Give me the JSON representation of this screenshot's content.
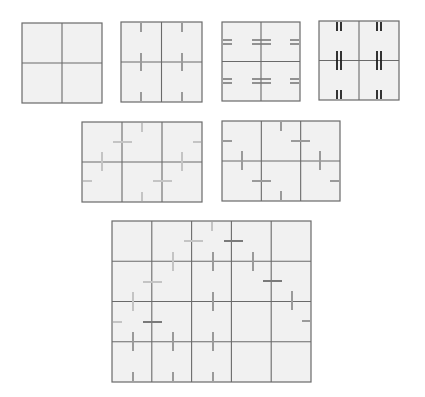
{
  "colors": {
    "background": "#ffffff",
    "panel_fill": "#f1f1f1",
    "grid": "#6a6a6a",
    "mark_light": "#c4c4c4",
    "mark_mid": "#9a9a9a",
    "mark_dark": "#7a7a7a",
    "mark_black": "#1e1e1e"
  },
  "panels": [
    {
      "id": "panel-2x2-empty",
      "x": 22,
      "y": 23,
      "w": 80,
      "h": 80,
      "cols": 2,
      "rows": 2,
      "marks": []
    },
    {
      "id": "panel-2x2-vertical-ticks",
      "x": 121,
      "y": 22,
      "w": 81,
      "h": 80,
      "cols": 2,
      "rows": 2,
      "marks": [
        {
          "x1": 141,
          "y1": 23,
          "x2": 141,
          "y2": 32,
          "color": "mark_mid",
          "w": 2
        },
        {
          "x1": 182,
          "y1": 23,
          "x2": 182,
          "y2": 32,
          "color": "mark_mid",
          "w": 2
        },
        {
          "x1": 141,
          "y1": 53,
          "x2": 141,
          "y2": 71,
          "color": "mark_mid",
          "w": 2
        },
        {
          "x1": 182,
          "y1": 53,
          "x2": 182,
          "y2": 71,
          "color": "mark_mid",
          "w": 2
        },
        {
          "x1": 141,
          "y1": 92,
          "x2": 141,
          "y2": 101,
          "color": "mark_mid",
          "w": 2
        },
        {
          "x1": 182,
          "y1": 92,
          "x2": 182,
          "y2": 101,
          "color": "mark_mid",
          "w": 2
        }
      ]
    },
    {
      "id": "panel-2x2-double-horizontal",
      "x": 222,
      "y": 22,
      "w": 78,
      "h": 79,
      "cols": 2,
      "rows": 2,
      "marks": [
        {
          "x1": 223,
          "y1": 40,
          "x2": 232,
          "y2": 40,
          "color": "mark_dark",
          "w": 1.6
        },
        {
          "x1": 223,
          "y1": 44,
          "x2": 232,
          "y2": 44,
          "color": "mark_dark",
          "w": 1.6
        },
        {
          "x1": 252,
          "y1": 40,
          "x2": 271,
          "y2": 40,
          "color": "mark_dark",
          "w": 1.6
        },
        {
          "x1": 252,
          "y1": 44,
          "x2": 271,
          "y2": 44,
          "color": "mark_dark",
          "w": 1.6
        },
        {
          "x1": 290,
          "y1": 40,
          "x2": 299,
          "y2": 40,
          "color": "mark_dark",
          "w": 1.6
        },
        {
          "x1": 290,
          "y1": 44,
          "x2": 299,
          "y2": 44,
          "color": "mark_dark",
          "w": 1.6
        },
        {
          "x1": 223,
          "y1": 79,
          "x2": 232,
          "y2": 79,
          "color": "mark_dark",
          "w": 1.6
        },
        {
          "x1": 223,
          "y1": 83,
          "x2": 232,
          "y2": 83,
          "color": "mark_dark",
          "w": 1.6
        },
        {
          "x1": 252,
          "y1": 79,
          "x2": 271,
          "y2": 79,
          "color": "mark_dark",
          "w": 1.6
        },
        {
          "x1": 252,
          "y1": 83,
          "x2": 271,
          "y2": 83,
          "color": "mark_dark",
          "w": 1.6
        },
        {
          "x1": 290,
          "y1": 79,
          "x2": 299,
          "y2": 79,
          "color": "mark_dark",
          "w": 1.6
        },
        {
          "x1": 290,
          "y1": 83,
          "x2": 299,
          "y2": 83,
          "color": "mark_dark",
          "w": 1.6
        }
      ]
    },
    {
      "id": "panel-2x2-double-vertical",
      "x": 319,
      "y": 21,
      "w": 80,
      "h": 79,
      "cols": 2,
      "rows": 2,
      "marks": [
        {
          "x1": 337,
          "y1": 22,
          "x2": 337,
          "y2": 31,
          "color": "mark_black",
          "w": 1.8
        },
        {
          "x1": 341,
          "y1": 22,
          "x2": 341,
          "y2": 31,
          "color": "mark_black",
          "w": 1.8
        },
        {
          "x1": 377,
          "y1": 22,
          "x2": 377,
          "y2": 31,
          "color": "mark_black",
          "w": 1.8
        },
        {
          "x1": 381,
          "y1": 22,
          "x2": 381,
          "y2": 31,
          "color": "mark_black",
          "w": 1.8
        },
        {
          "x1": 337,
          "y1": 51,
          "x2": 337,
          "y2": 70,
          "color": "mark_black",
          "w": 1.8
        },
        {
          "x1": 341,
          "y1": 51,
          "x2": 341,
          "y2": 70,
          "color": "mark_black",
          "w": 1.8
        },
        {
          "x1": 377,
          "y1": 51,
          "x2": 377,
          "y2": 70,
          "color": "mark_black",
          "w": 1.8
        },
        {
          "x1": 381,
          "y1": 51,
          "x2": 381,
          "y2": 70,
          "color": "mark_black",
          "w": 1.8
        },
        {
          "x1": 337,
          "y1": 90,
          "x2": 337,
          "y2": 99,
          "color": "mark_black",
          "w": 1.8
        },
        {
          "x1": 341,
          "y1": 90,
          "x2": 341,
          "y2": 99,
          "color": "mark_black",
          "w": 1.8
        },
        {
          "x1": 377,
          "y1": 90,
          "x2": 377,
          "y2": 99,
          "color": "mark_black",
          "w": 1.8
        },
        {
          "x1": 381,
          "y1": 90,
          "x2": 381,
          "y2": 99,
          "color": "mark_black",
          "w": 1.8
        }
      ]
    },
    {
      "id": "panel-3x2-light-marks",
      "x": 82,
      "y": 122,
      "w": 120,
      "h": 80,
      "cols": 3,
      "rows": 2,
      "marks": [
        {
          "x1": 142,
          "y1": 123,
          "x2": 142,
          "y2": 132,
          "color": "mark_light",
          "w": 2
        },
        {
          "x1": 113,
          "y1": 142,
          "x2": 132,
          "y2": 142,
          "color": "mark_light",
          "w": 2
        },
        {
          "x1": 193,
          "y1": 142,
          "x2": 201,
          "y2": 142,
          "color": "mark_light",
          "w": 2
        },
        {
          "x1": 102,
          "y1": 152,
          "x2": 102,
          "y2": 171,
          "color": "mark_light",
          "w": 2
        },
        {
          "x1": 182,
          "y1": 152,
          "x2": 182,
          "y2": 171,
          "color": "mark_light",
          "w": 2
        },
        {
          "x1": 83,
          "y1": 181,
          "x2": 92,
          "y2": 181,
          "color": "mark_light",
          "w": 2
        },
        {
          "x1": 153,
          "y1": 181,
          "x2": 172,
          "y2": 181,
          "color": "mark_light",
          "w": 2
        },
        {
          "x1": 142,
          "y1": 192,
          "x2": 142,
          "y2": 201,
          "color": "mark_light",
          "w": 2
        }
      ]
    },
    {
      "id": "panel-3x2-mid-marks",
      "x": 222,
      "y": 121,
      "w": 118,
      "h": 80,
      "cols": 3,
      "rows": 2,
      "marks": [
        {
          "x1": 281,
          "y1": 122,
          "x2": 281,
          "y2": 131,
          "color": "mark_mid",
          "w": 2
        },
        {
          "x1": 223,
          "y1": 141,
          "x2": 232,
          "y2": 141,
          "color": "mark_mid",
          "w": 2
        },
        {
          "x1": 291,
          "y1": 141,
          "x2": 310,
          "y2": 141,
          "color": "mark_mid",
          "w": 2
        },
        {
          "x1": 242,
          "y1": 151,
          "x2": 242,
          "y2": 170,
          "color": "mark_mid",
          "w": 2
        },
        {
          "x1": 320,
          "y1": 151,
          "x2": 320,
          "y2": 170,
          "color": "mark_mid",
          "w": 2
        },
        {
          "x1": 252,
          "y1": 181,
          "x2": 271,
          "y2": 181,
          "color": "mark_mid",
          "w": 2
        },
        {
          "x1": 330,
          "y1": 181,
          "x2": 339,
          "y2": 181,
          "color": "mark_mid",
          "w": 2
        },
        {
          "x1": 281,
          "y1": 191,
          "x2": 281,
          "y2": 200,
          "color": "mark_mid",
          "w": 2
        }
      ]
    },
    {
      "id": "panel-5x4-mixed-marks",
      "x": 112,
      "y": 221,
      "w": 199,
      "h": 161,
      "cols": 5,
      "rows": 4,
      "marks": [
        {
          "x1": 212,
          "y1": 222,
          "x2": 212,
          "y2": 231,
          "color": "mark_light",
          "w": 2
        },
        {
          "x1": 184,
          "y1": 241,
          "x2": 203,
          "y2": 241,
          "color": "mark_light",
          "w": 2
        },
        {
          "x1": 224,
          "y1": 241,
          "x2": 243,
          "y2": 241,
          "color": "mark_dark",
          "w": 2
        },
        {
          "x1": 173,
          "y1": 252,
          "x2": 173,
          "y2": 271,
          "color": "mark_light",
          "w": 2
        },
        {
          "x1": 213,
          "y1": 252,
          "x2": 213,
          "y2": 271,
          "color": "mark_mid",
          "w": 2
        },
        {
          "x1": 253,
          "y1": 252,
          "x2": 253,
          "y2": 271,
          "color": "mark_mid",
          "w": 2
        },
        {
          "x1": 143,
          "y1": 282,
          "x2": 162,
          "y2": 282,
          "color": "mark_light",
          "w": 2
        },
        {
          "x1": 263,
          "y1": 281,
          "x2": 282,
          "y2": 281,
          "color": "mark_dark",
          "w": 2
        },
        {
          "x1": 133,
          "y1": 292,
          "x2": 133,
          "y2": 311,
          "color": "mark_light",
          "w": 2
        },
        {
          "x1": 213,
          "y1": 292,
          "x2": 213,
          "y2": 311,
          "color": "mark_mid",
          "w": 2
        },
        {
          "x1": 292,
          "y1": 291,
          "x2": 292,
          "y2": 310,
          "color": "mark_mid",
          "w": 2
        },
        {
          "x1": 113,
          "y1": 322,
          "x2": 122,
          "y2": 322,
          "color": "mark_light",
          "w": 2
        },
        {
          "x1": 143,
          "y1": 322,
          "x2": 162,
          "y2": 322,
          "color": "mark_dark",
          "w": 2
        },
        {
          "x1": 302,
          "y1": 321,
          "x2": 310,
          "y2": 321,
          "color": "mark_mid",
          "w": 2
        },
        {
          "x1": 133,
          "y1": 332,
          "x2": 133,
          "y2": 351,
          "color": "mark_mid",
          "w": 2
        },
        {
          "x1": 173,
          "y1": 332,
          "x2": 173,
          "y2": 351,
          "color": "mark_mid",
          "w": 2
        },
        {
          "x1": 213,
          "y1": 332,
          "x2": 213,
          "y2": 351,
          "color": "mark_mid",
          "w": 2
        },
        {
          "x1": 133,
          "y1": 372,
          "x2": 133,
          "y2": 381,
          "color": "mark_mid",
          "w": 2
        },
        {
          "x1": 173,
          "y1": 372,
          "x2": 173,
          "y2": 381,
          "color": "mark_mid",
          "w": 2
        },
        {
          "x1": 213,
          "y1": 372,
          "x2": 213,
          "y2": 381,
          "color": "mark_mid",
          "w": 2
        }
      ]
    }
  ]
}
